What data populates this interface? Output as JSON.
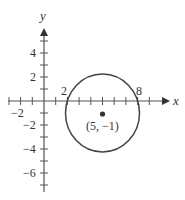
{
  "diagram": {
    "type": "circle-on-coordinate-plane",
    "colors": {
      "axis": "#555555",
      "circle": "#444444",
      "text": "#333333",
      "background": "#ffffff"
    },
    "axes": {
      "x_label": "x",
      "y_label": "y",
      "x_range": [
        -3,
        9
      ],
      "y_range": [
        -7,
        6
      ],
      "x_ticks": [
        -3,
        -2,
        -1,
        1,
        2,
        3,
        4,
        5,
        6,
        7,
        8,
        9
      ],
      "y_ticks": [
        -7,
        -6,
        -5,
        -4,
        -3,
        -2,
        -1,
        1,
        2,
        3,
        4,
        5
      ]
    },
    "tick_labels": {
      "x_neg2": "−2",
      "x_2": "2",
      "x_8": "8",
      "y_4": "4",
      "y_2": "2",
      "y_neg2": "−2",
      "y_neg4": "−4",
      "y_neg6": "−6"
    },
    "circle": {
      "center": [
        5,
        -1
      ],
      "radius_squared": 10,
      "x_intercepts": [
        2,
        8
      ]
    },
    "center_label": "(5, −1)"
  }
}
